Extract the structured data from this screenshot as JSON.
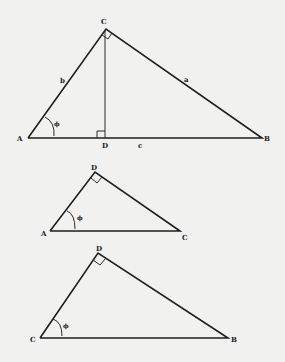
{
  "diagram": {
    "figures": [
      {
        "id": "triangle-ABC",
        "vertices": {
          "A": "A",
          "B": "B",
          "C": "C",
          "D": "D"
        },
        "sides": {
          "b": "b",
          "a": "a",
          "c": "c"
        },
        "angle_label": "ϕ",
        "right_angles": [
          "C",
          "D"
        ]
      },
      {
        "id": "triangle-ADC",
        "vertices": {
          "D": "D",
          "A": "A",
          "C": "C"
        },
        "angle_label": "ϕ",
        "right_angles": [
          "D"
        ]
      },
      {
        "id": "triangle-CDB",
        "vertices": {
          "D": "D",
          "C": "C",
          "B": "B"
        },
        "angle_label": "ϕ",
        "right_angles": [
          "D"
        ]
      }
    ],
    "colors": {
      "line": "#1e1e1e",
      "background": "#f1f1ef"
    }
  }
}
